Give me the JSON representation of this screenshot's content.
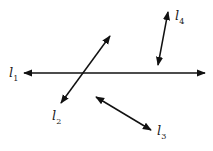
{
  "diagram": {
    "lines": [
      {
        "id": "l1",
        "name": "l",
        "sub": "1",
        "x1": 24,
        "y1": 73,
        "x2": 205,
        "y2": 73,
        "label_x": 9,
        "label_y": 66
      },
      {
        "id": "l2",
        "name": "l",
        "sub": "2",
        "x1": 110,
        "y1": 36,
        "x2": 61,
        "y2": 103,
        "label_x": 52,
        "label_y": 109
      },
      {
        "id": "l3",
        "name": "l",
        "sub": "3",
        "x1": 96,
        "y1": 97,
        "x2": 151,
        "y2": 130,
        "label_x": 157,
        "label_y": 124
      },
      {
        "id": "l4",
        "name": "l",
        "sub": "4",
        "x1": 168,
        "y1": 12,
        "x2": 158,
        "y2": 65,
        "label_x": 175,
        "label_y": 9
      }
    ],
    "stroke_color": "#111111"
  }
}
